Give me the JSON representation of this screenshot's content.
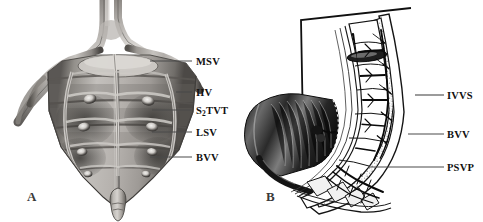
{
  "figure": {
    "type": "anatomical-figure",
    "background_color": "#ffffff",
    "width": 483,
    "height": 222,
    "panel_count": 2
  },
  "panel_a": {
    "letter": "A",
    "description": "Grayscale anatomical photograph, anterior view of sacrum and pelvic venous network",
    "labels": [
      {
        "id": "msv",
        "text": "MSV",
        "sub": "",
        "meaning": "median sacral vein",
        "x": 196,
        "y": 57,
        "leader_x1": 150,
        "leader_x2": 192,
        "leader_y": 61
      },
      {
        "id": "iiv",
        "text": "IIV",
        "sub": "",
        "meaning": "internal iliac vein",
        "x": 196,
        "y": 88,
        "leader_x1": 176,
        "leader_x2": 192,
        "leader_y": 92
      },
      {
        "id": "s2tvt",
        "text": "S",
        "sub": "2",
        "suffix": "TVT",
        "meaning": "S2 transverse venous trunk",
        "x": 196,
        "y": 106,
        "leader_x1": 152,
        "leader_x2": 192,
        "leader_y": 110
      },
      {
        "id": "lsv",
        "text": "LSV",
        "sub": "",
        "meaning": "lateral sacral vein",
        "x": 196,
        "y": 128,
        "leader_x1": 152,
        "leader_x2": 192,
        "leader_y": 132
      },
      {
        "id": "bvv",
        "text": "BVV",
        "sub": "",
        "meaning": "basivertebral vein",
        "x": 196,
        "y": 153,
        "leader_x1": 150,
        "leader_x2": 192,
        "leader_y": 157
      }
    ],
    "colors": {
      "bone_light": "#c9c6c2",
      "bone_mid": "#9a9691",
      "bone_dark": "#5d5a57",
      "shadow": "#2e2c2a",
      "vessel": "#6e6a66"
    }
  },
  "panel_b": {
    "letter": "B",
    "description": "Sagittal line drawing of lumbosacral spine showing vertebral venous plexuses, with bracket marker and shaded soft-tissue mass",
    "labels": [
      {
        "id": "ivvs",
        "text": "IVVS",
        "meaning": "internal vertebral venous system",
        "x": 447,
        "y": 91,
        "leader_x1": 415,
        "leader_x2": 444,
        "leader_y": 95
      },
      {
        "id": "bvv",
        "text": "BVV",
        "meaning": "basivertebral vein",
        "x": 447,
        "y": 130,
        "leader_x1": 408,
        "leader_x2": 444,
        "leader_y": 134
      },
      {
        "id": "psvp",
        "text": "PSVP",
        "meaning": "presacral venous plexus",
        "x": 447,
        "y": 163,
        "leader_x1": 368,
        "leader_x2": 444,
        "leader_y": 167
      }
    ],
    "colors": {
      "outline": "#1a1a1a",
      "trabecular": "#9c9c9c",
      "vessel": "#111111",
      "mass_dark": "#1d1d1d",
      "mass_mid": "#555555"
    }
  }
}
